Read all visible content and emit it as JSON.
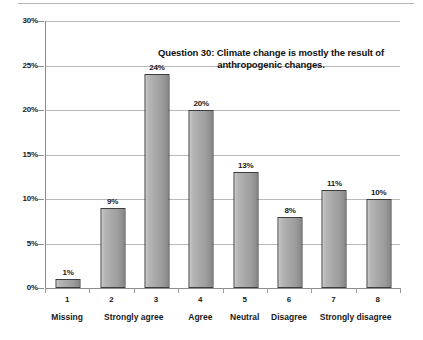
{
  "chart_data": {
    "type": "bar",
    "title_lines": [
      "Question 30: Climate change is mostly the result of",
      "anthropogenic changes."
    ],
    "xlabel": "",
    "ylabel": "",
    "ylim": [
      0,
      30
    ],
    "y_unit": "%",
    "grid": true,
    "legend": "none",
    "categories": [
      "1",
      "2",
      "3",
      "4",
      "5",
      "6",
      "7",
      "8"
    ],
    "category_groups": [
      {
        "label": "Missing",
        "spans": [
          "1"
        ],
        "center_index": 0
      },
      {
        "label": "Strongly agree",
        "spans": [
          "2",
          "3"
        ],
        "center_index": 1.5
      },
      {
        "label": "Agree",
        "spans": [
          "4"
        ],
        "center_index": 3
      },
      {
        "label": "Neutral",
        "spans": [
          "5"
        ],
        "center_index": 4
      },
      {
        "label": "Disagree",
        "spans": [
          "6"
        ],
        "center_index": 5
      },
      {
        "label": "Strongly disagree",
        "spans": [
          "7",
          "8"
        ],
        "center_index": 6.5
      }
    ],
    "values": [
      1,
      9,
      24,
      20,
      13,
      8,
      11,
      10
    ],
    "value_labels": [
      "1%",
      "9%",
      "24%",
      "20%",
      "13%",
      "8%",
      "11%",
      "10%"
    ],
    "y_ticks": [
      0,
      5,
      10,
      15,
      20,
      25,
      30
    ],
    "y_tick_labels": [
      "0%",
      "5%",
      "10%",
      "15%",
      "20%",
      "25%",
      "30%"
    ],
    "colors": {
      "bar_fill_light": "#c9c9c9",
      "bar_fill_dark": "#848484",
      "bar_border": "#3d3d3d",
      "gridline": "#b9b9b9",
      "axis": "#8c8c8c",
      "text": "#1a1a1a",
      "background": "#ffffff"
    }
  }
}
